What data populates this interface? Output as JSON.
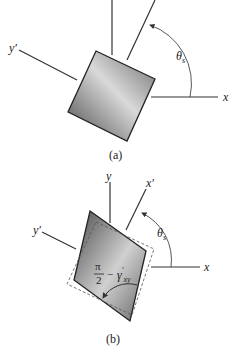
{
  "figure_a": {
    "caption": "(a)",
    "axes": {
      "x": "x",
      "x_prime": "x′",
      "y_prime": "y′"
    },
    "angle_label": "θ",
    "angle_subscript": "s"
  },
  "figure_b": {
    "caption": "(b)",
    "axes": {
      "x": "x",
      "y": "y",
      "x_prime": "x′",
      "y_prime": "y′"
    },
    "angle_label": "θ",
    "angle_subscript": "s",
    "shear_numerator": "π",
    "shear_denominator": "2",
    "shear_minus": "−",
    "shear_gamma": "γ",
    "shear_prime": "′",
    "shear_subscript": "xy"
  },
  "colors": {
    "line": "#333333",
    "fill_dark": "#555555",
    "fill_light": "#d8d8d8"
  }
}
